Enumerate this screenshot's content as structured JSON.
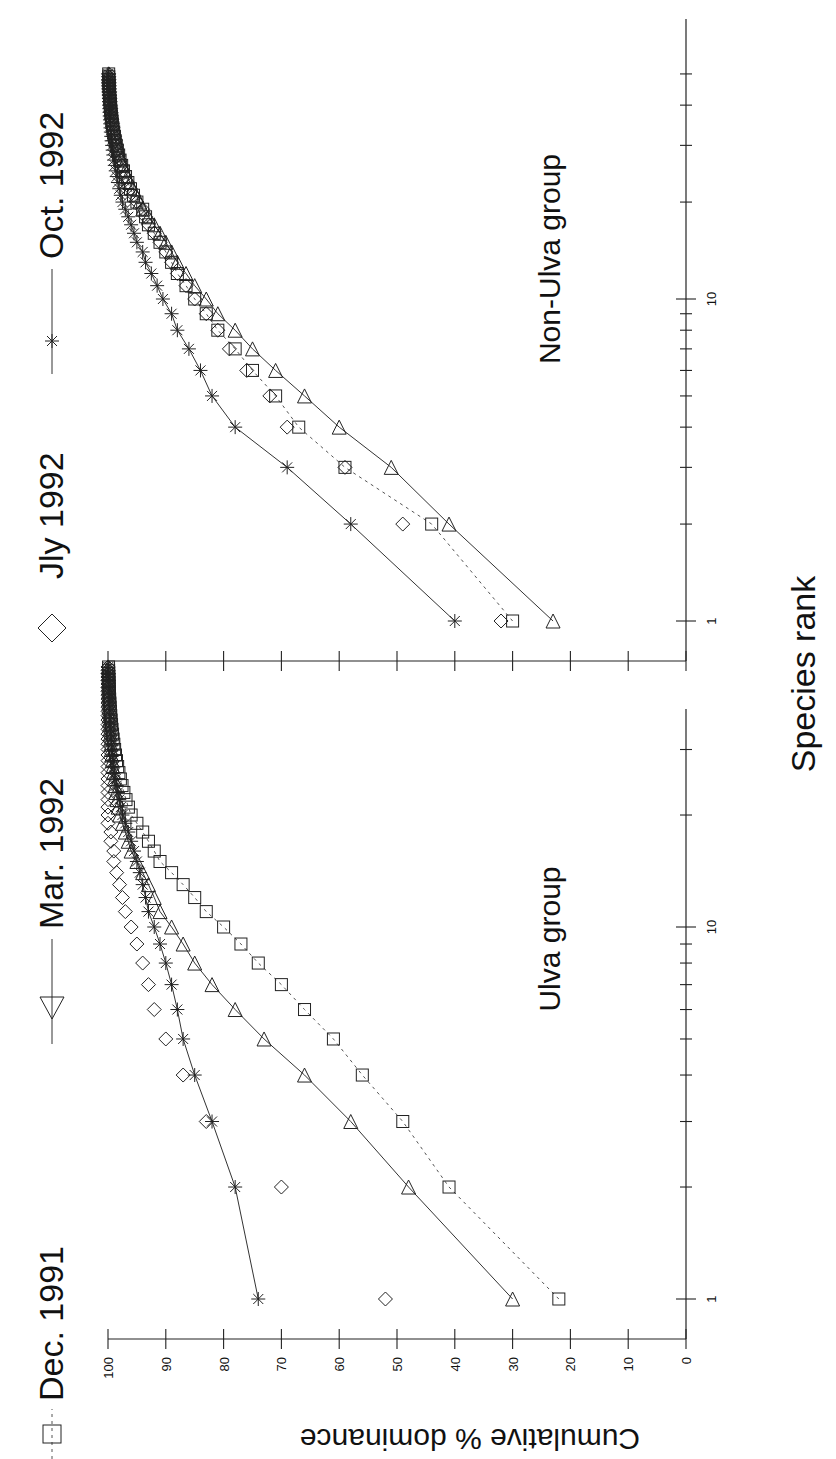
{
  "figure": {
    "orientation": "rotated-90-ccw",
    "panels": [
      {
        "name": "ulva",
        "label": "Ulva group"
      },
      {
        "name": "non-ulva",
        "label": "Non-Ulva group"
      }
    ],
    "xlabel": "Species rank",
    "ylabel": "Cumulative % dominance",
    "y_ticks": [
      "0",
      "10",
      "20",
      "30",
      "40",
      "50",
      "60",
      "70",
      "80",
      "90",
      "100"
    ],
    "x_tick_labels": [
      "1",
      "10"
    ],
    "legend": [
      {
        "label": "Dec. 1991",
        "marker": "square",
        "line": "dotted"
      },
      {
        "label": "Mar. 1992",
        "marker": "triangle",
        "line": "solid"
      },
      {
        "label": "Jly 1992",
        "marker": "diamond",
        "line": "none"
      },
      {
        "label": "Oct. 1992",
        "marker": "asterisk",
        "line": "solid"
      }
    ]
  },
  "chart_data": [
    {
      "type": "line",
      "title": "Ulva group",
      "xlabel": "Species rank",
      "ylabel": "Cumulative % dominance",
      "xscale": "log",
      "xlim": [
        1,
        55
      ],
      "ylim": [
        0,
        100
      ],
      "grid": false,
      "legend_position": "top (shared)",
      "x": [
        1,
        2,
        3,
        4,
        5,
        6,
        7,
        8,
        9,
        10,
        11,
        12,
        13,
        14,
        15,
        16,
        17,
        18,
        19,
        20
      ],
      "series": [
        {
          "name": "Dec. 1991",
          "marker": "square",
          "line": "dotted",
          "values": [
            22,
            41,
            49,
            56,
            61,
            66,
            70,
            74,
            77,
            80,
            83,
            85,
            87,
            89,
            91,
            92,
            93,
            94,
            95,
            96
          ]
        },
        {
          "name": "Mar. 1992",
          "marker": "triangle",
          "line": "solid",
          "values": [
            30,
            48,
            58,
            66,
            73,
            78,
            82,
            85,
            87,
            89,
            91,
            92,
            93,
            94,
            95,
            96,
            96.5,
            97,
            97.5,
            98
          ]
        },
        {
          "name": "Jly 1992",
          "marker": "diamond",
          "line": "none",
          "values": [
            52,
            70,
            83,
            87,
            90,
            92,
            93,
            94,
            95,
            96,
            97,
            97.5,
            98,
            98.5,
            99,
            99,
            99.5,
            99.5,
            100,
            100
          ]
        },
        {
          "name": "Oct. 1992",
          "marker": "asterisk",
          "line": "solid",
          "values": [
            74,
            78,
            82,
            85,
            87,
            88,
            89,
            90,
            91,
            92,
            93,
            93.5,
            94,
            94.5,
            95,
            95.5,
            96,
            96.5,
            97,
            97.5
          ]
        }
      ]
    },
    {
      "type": "line",
      "title": "Non-Ulva group",
      "xlabel": "Species rank",
      "ylabel": "Cumulative % dominance",
      "xscale": "log",
      "xlim": [
        1,
        55
      ],
      "ylim": [
        0,
        100
      ],
      "grid": false,
      "x": [
        1,
        2,
        3,
        4,
        5,
        6,
        7,
        8,
        9,
        10,
        11,
        12,
        13,
        14,
        15,
        16,
        17,
        18,
        19,
        20
      ],
      "series": [
        {
          "name": "Dec. 1991",
          "marker": "square",
          "line": "dotted",
          "values": [
            30,
            44,
            59,
            67,
            71,
            75,
            78,
            81,
            83,
            85,
            86.5,
            88,
            89,
            90,
            91,
            92,
            93,
            93.5,
            94,
            95
          ]
        },
        {
          "name": "Mar. 1992",
          "marker": "triangle",
          "line": "solid",
          "values": [
            23,
            41,
            51,
            60,
            66,
            71,
            75,
            78,
            81,
            83,
            85,
            86.5,
            88,
            89,
            90,
            91,
            92,
            93,
            94,
            94.5
          ]
        },
        {
          "name": "Jly 1992",
          "marker": "diamond",
          "line": "none",
          "values": [
            32,
            49,
            59,
            69,
            72,
            76,
            79,
            81,
            83,
            85,
            86.5,
            88,
            89,
            90,
            91,
            92,
            93,
            93.5,
            94,
            95
          ]
        },
        {
          "name": "Oct. 1992",
          "marker": "asterisk",
          "line": "solid",
          "values": [
            40,
            58,
            69,
            78,
            82,
            84,
            86,
            88,
            89,
            90.5,
            91.5,
            92.5,
            93.5,
            94,
            95,
            95.5,
            96,
            96.5,
            97,
            97.5
          ]
        }
      ]
    }
  ]
}
